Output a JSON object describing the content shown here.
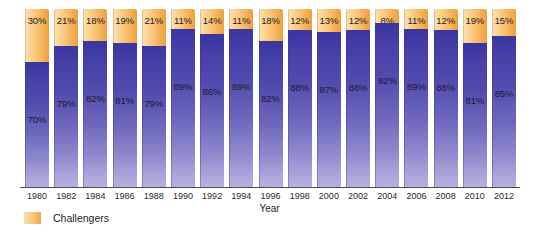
{
  "chart_data": {
    "type": "bar",
    "title": "",
    "subtitle": "",
    "xlabel": "Year",
    "ylabel": "",
    "ylim": [
      0,
      100
    ],
    "grid": false,
    "stacked": true,
    "stack_total_percent": 100,
    "legend_position": "bottom-left",
    "categories": [
      "1980",
      "1982",
      "1984",
      "1986",
      "1988",
      "1990",
      "1992",
      "1994",
      "1996",
      "1998",
      "2000",
      "2002",
      "2004",
      "2006",
      "2008",
      "2010",
      "2012"
    ],
    "series": [
      {
        "name": "Challengers",
        "color": "#f5b košt",
        "values": [
          30,
          21,
          18,
          19,
          21,
          11,
          14,
          11,
          18,
          12,
          13,
          12,
          8,
          11,
          12,
          19,
          15
        ],
        "labels": [
          "30%",
          "21%",
          "18%",
          "19%",
          "21%",
          "11%",
          "14%",
          "11%",
          "18%",
          "12%",
          "13%",
          "12%",
          "8%",
          "11%",
          "12%",
          "19%",
          "15%"
        ]
      },
      {
        "name": "Incumbents",
        "color": "#4a44ab",
        "values": [
          70,
          79,
          82,
          81,
          79,
          89,
          86,
          89,
          82,
          88,
          87,
          88,
          92,
          89,
          88,
          81,
          85
        ],
        "labels": [
          "70%",
          "79%",
          "82%",
          "81%",
          "79%",
          "89%",
          "86%",
          "89%",
          "82%",
          "88%",
          "87%",
          "88%",
          "92%",
          "89%",
          "88%",
          "81%",
          "85%"
        ]
      }
    ],
    "legend": [
      {
        "label": "Challengers",
        "swatch_color": "#f5bd77"
      }
    ],
    "colors": {
      "challengers_light": "#fbe0b4",
      "challengers_dark": "#eda13f",
      "incumbents_top": "#3b35a0",
      "incumbents_bottom": "#b4b1e0",
      "axis": "#4a4a58",
      "text": "#1d1d1d",
      "background": "#ffffff"
    }
  }
}
